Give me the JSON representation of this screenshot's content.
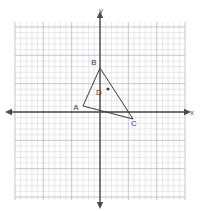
{
  "figure": {
    "kind": "coordinate-plane-geometry-figure",
    "background_color": "#ffffff",
    "width": 203,
    "height": 211
  },
  "grid": {
    "minor_color": "#d9d9de",
    "major_color": "#bfbfc6",
    "cell_px": 5.67,
    "major_every": 5,
    "left_px": 15,
    "top_px": 22,
    "right_px": 185,
    "bottom_px": 200,
    "columns": 30,
    "rows": 31
  },
  "axes": {
    "color": "#4a4a4a",
    "x_axis_label": "x",
    "y_axis_label": "y",
    "origin_px": {
      "x": 100,
      "y": 112
    },
    "x_range_units": [
      -15,
      15
    ],
    "y_range_units": [
      -15.5,
      15.5
    ],
    "arrowheads": true
  },
  "chart_data": {
    "type": "scatter",
    "title": "",
    "xlabel": "x",
    "ylabel": "y",
    "xlim": [
      -15,
      15
    ],
    "ylim": [
      -15.5,
      15.5
    ],
    "grid": true,
    "legend": null,
    "unit_px": 5.67,
    "points": [
      {
        "label": "A",
        "x": -3,
        "y": 1,
        "px": 83,
        "py": 106,
        "label_px": 76,
        "label_py": 110,
        "marker": false
      },
      {
        "label": "B",
        "x": 0,
        "y": 7.8,
        "px": 100,
        "py": 68,
        "label_px": 94,
        "label_py": 65,
        "marker": false
      },
      {
        "label": "C",
        "x": 5.8,
        "y": -1.2,
        "px": 133,
        "py": 119,
        "label_px": 134,
        "label_py": 126,
        "marker": false
      },
      {
        "label": "D",
        "x": 1.4,
        "y": 3.9,
        "px": 108,
        "py": 89,
        "label_px": 99,
        "label_py": 95,
        "marker": true
      }
    ],
    "shapes": [
      {
        "name": "triangle-ABC",
        "vertices": [
          "A",
          "B",
          "C"
        ],
        "stroke": "#3b3b3b",
        "fill": "none",
        "stroke_width": 1
      }
    ]
  }
}
